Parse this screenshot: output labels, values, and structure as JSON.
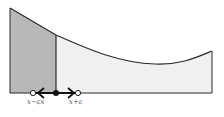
{
  "diagram": {
    "labels": {
      "left": "x−εx",
      "right": "x+ε"
    },
    "colors": {
      "shaded": "#b8b8b8",
      "light": "#f0f0f0",
      "stroke": "#2a2a2a"
    }
  }
}
